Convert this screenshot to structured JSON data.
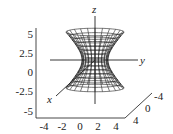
{
  "chart_data": {
    "type": "surface3d",
    "title": "",
    "surface": "hyperboloid of one sheet",
    "axes": {
      "x": {
        "label": "x",
        "ticks": [
          "-4",
          "-2",
          "0",
          "2",
          "4"
        ],
        "range": [
          -4,
          4
        ]
      },
      "y": {
        "label": "y",
        "ticks": [
          "-4",
          "0",
          "4"
        ],
        "range": [
          -4,
          4
        ]
      },
      "z": {
        "label": "z",
        "ticks": [
          "5",
          "2.5",
          "0",
          "-2.5",
          "-5"
        ],
        "range": [
          -5,
          5
        ]
      }
    },
    "bottom_ticks": [
      "-4",
      "-2",
      "0",
      "2",
      "4"
    ],
    "depth_ticks": [
      "-4",
      "0",
      "4"
    ],
    "vertical_ticks": [
      "5",
      "2.5",
      "0",
      "-2.5",
      "-5"
    ],
    "grid": false,
    "mesh": {
      "rings": 14,
      "meridians": 24
    },
    "colors": {
      "line": "#222222",
      "background": "#ffffff"
    }
  }
}
